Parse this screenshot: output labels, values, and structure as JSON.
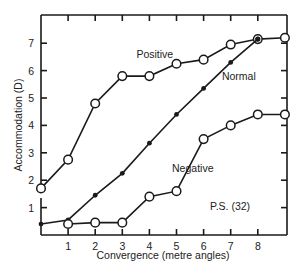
{
  "chart_data": {
    "type": "line",
    "title": "",
    "xlabel": "Convergence (metre angles)",
    "ylabel": "Accommodation (D)",
    "xlim": [
      0,
      9.3
    ],
    "ylim": [
      0,
      7.35
    ],
    "x_ticks": [
      "1",
      "2",
      "3",
      "4",
      "5",
      "6",
      "7",
      "8"
    ],
    "y_ticks": [
      "1",
      "2",
      "3",
      "4",
      "5",
      "6",
      "7"
    ],
    "grid": false,
    "annotation": "P.S. (32)",
    "series": [
      {
        "name": "Positive",
        "marker": "open-circle",
        "x": [
          0,
          1,
          2,
          3,
          4,
          5,
          6,
          7,
          8,
          9
        ],
        "y": [
          1.7,
          2.75,
          4.8,
          5.8,
          5.8,
          6.25,
          6.4,
          6.95,
          7.15,
          7.2
        ]
      },
      {
        "name": "Normal",
        "marker": "filled-dot",
        "x": [
          0,
          1,
          2,
          3,
          4,
          5,
          6,
          7,
          8
        ],
        "y": [
          0.4,
          0.55,
          1.45,
          2.25,
          3.35,
          4.4,
          5.35,
          6.3,
          7.15
        ]
      },
      {
        "name": "Negative",
        "marker": "open-circle",
        "x": [
          1,
          2,
          3,
          4,
          5,
          6,
          7,
          8,
          9
        ],
        "y": [
          0.4,
          0.45,
          0.45,
          1.4,
          1.6,
          3.5,
          4.0,
          4.4,
          4.4
        ]
      }
    ],
    "series_labels": [
      {
        "text": "Positive",
        "x": 4.2,
        "y": 6.45
      },
      {
        "text": "Normal",
        "x": 7.3,
        "y": 5.65
      },
      {
        "text": "Negative",
        "x": 5.6,
        "y": 2.3
      }
    ]
  }
}
